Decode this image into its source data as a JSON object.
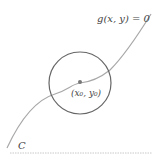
{
  "diagram": {
    "curve_label": "g(x, y) = 0",
    "curve_name": "C",
    "point_label": "(x₀, y₀)",
    "colors": {
      "curve": "#a8a8a8",
      "circle": "#666666",
      "point": "#777777",
      "text": "#444444",
      "baseline": "#c8c8c8"
    }
  }
}
